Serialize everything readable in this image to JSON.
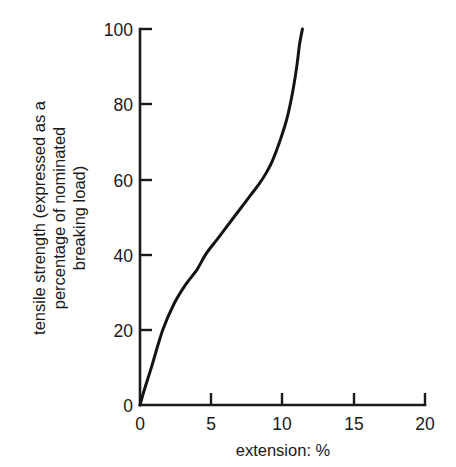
{
  "chart_data": {
    "type": "line",
    "title": "",
    "xlabel": "extension: %",
    "ylabel": "tensile strength (expressed as a percentage of nominated breaking load)",
    "ylabel_lines": [
      "tensile strength (expressed as a",
      "percentage of nominated",
      "breaking load)"
    ],
    "xlim": [
      0,
      20
    ],
    "ylim": [
      0,
      100
    ],
    "xticks": [
      0,
      5,
      10,
      15,
      20
    ],
    "xtick_labels": [
      "0",
      "5",
      "10",
      "15",
      "20"
    ],
    "yticks": [
      0,
      20,
      40,
      60,
      80,
      100
    ],
    "ytick_labels": [
      "0",
      "20",
      "40",
      "60",
      "80",
      "100"
    ],
    "grid": false,
    "legend": "none",
    "line_color": "#141414",
    "axis_color": "#1a1a1a",
    "background": "#ffffff",
    "series": [
      {
        "name": "tensile strength vs extension",
        "x": [
          0.0,
          0.3,
          0.8,
          1.6,
          2.4,
          3.2,
          4.0,
          4.6,
          5.4,
          6.2,
          7.0,
          7.8,
          8.4,
          8.9,
          9.3,
          9.8,
          10.3,
          10.7,
          11.0,
          11.2,
          11.4
        ],
        "y": [
          0,
          4,
          10,
          20,
          27,
          32,
          36,
          40,
          44,
          48,
          52,
          56,
          59,
          62,
          65,
          70,
          76,
          83,
          90,
          96,
          100
        ]
      }
    ],
    "annotations": []
  }
}
